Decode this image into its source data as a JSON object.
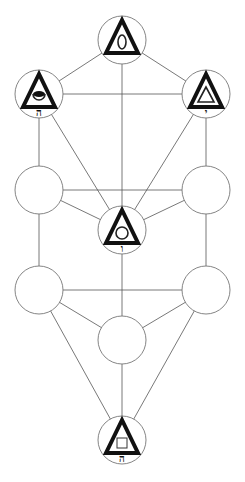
{
  "diagram": {
    "title": "",
    "nodes": [
      {
        "id": "n1",
        "x": 122,
        "y": 40,
        "symbol": "triangle-eye",
        "letter": ""
      },
      {
        "id": "n2",
        "x": 39,
        "y": 94,
        "symbol": "triangle-cup",
        "letter": "ה"
      },
      {
        "id": "n3",
        "x": 206,
        "y": 94,
        "symbol": "triangle-triangle",
        "letter": "י"
      },
      {
        "id": "n4",
        "x": 39,
        "y": 190,
        "symbol": "",
        "letter": ""
      },
      {
        "id": "n5",
        "x": 206,
        "y": 190,
        "symbol": "",
        "letter": ""
      },
      {
        "id": "n6",
        "x": 122,
        "y": 230,
        "symbol": "triangle-circle",
        "letter": "ו"
      },
      {
        "id": "n7",
        "x": 39,
        "y": 290,
        "symbol": "",
        "letter": ""
      },
      {
        "id": "n8",
        "x": 206,
        "y": 290,
        "symbol": "",
        "letter": ""
      },
      {
        "id": "n9",
        "x": 122,
        "y": 340,
        "symbol": "",
        "letter": ""
      },
      {
        "id": "n10",
        "x": 122,
        "y": 440,
        "symbol": "triangle-square",
        "letter": "ה"
      }
    ],
    "edges": [
      [
        "n1",
        "n2"
      ],
      [
        "n1",
        "n3"
      ],
      [
        "n1",
        "n6"
      ],
      [
        "n2",
        "n3"
      ],
      [
        "n2",
        "n4"
      ],
      [
        "n2",
        "n6"
      ],
      [
        "n3",
        "n5"
      ],
      [
        "n3",
        "n6"
      ],
      [
        "n4",
        "n5"
      ],
      [
        "n4",
        "n6"
      ],
      [
        "n5",
        "n6"
      ],
      [
        "n4",
        "n7"
      ],
      [
        "n5",
        "n8"
      ],
      [
        "n6",
        "n9"
      ],
      [
        "n7",
        "n8"
      ],
      [
        "n7",
        "n9"
      ],
      [
        "n8",
        "n9"
      ],
      [
        "n7",
        "n10"
      ],
      [
        "n8",
        "n10"
      ],
      [
        "n9",
        "n10"
      ]
    ],
    "node_radius": 24,
    "colors": {
      "stroke": "#555555",
      "symbol": "#111111",
      "background": "#ffffff"
    }
  }
}
